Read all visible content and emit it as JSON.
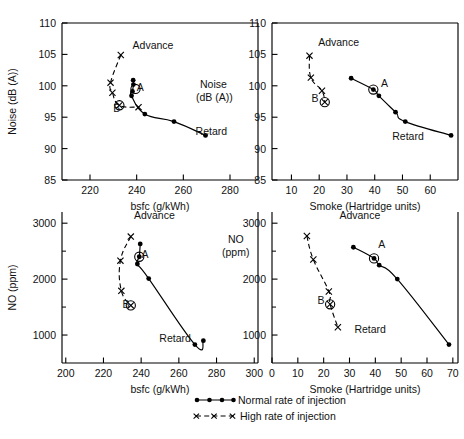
{
  "header": {
    "running_head": ""
  },
  "figure": {
    "legend": {
      "normal": {
        "label": "Normal rate of injection",
        "marker": "filled-circle",
        "line": "solid"
      },
      "high": {
        "label": "High rate of injection",
        "marker": "x-cross",
        "line": "dashed"
      }
    },
    "annotations": {
      "advance": "Advance",
      "retard": "Retard",
      "point_a": "A",
      "point_b": "B"
    }
  },
  "chart_data": [
    {
      "id": "noise-vs-bsfc",
      "panel": "top-left",
      "type": "scatter",
      "title": "",
      "xlabel": "bsfc (g/kWh)",
      "ylabel": "Noise (dB (A))",
      "inner_label": "Noise\n(dB (A))",
      "xlim": [
        208,
        292
      ],
      "ylim": [
        85,
        110
      ],
      "xticks": [
        220,
        240,
        260,
        280
      ],
      "yticks": [
        85,
        90,
        95,
        100,
        105,
        110
      ],
      "grid": false,
      "legend_position": "figure-bottom-right",
      "annotations": [
        {
          "text": "Advance",
          "x": 247,
          "y": 105.8
        },
        {
          "text": "Retard",
          "x": 272,
          "y": 92.2
        },
        {
          "text": "A",
          "x": 241.5,
          "y": 99.2
        },
        {
          "text": "B",
          "x": 231.5,
          "y": 95.9
        }
      ],
      "series": [
        {
          "name": "Normal rate of injection",
          "marker": "filled-circle",
          "line": "solid",
          "points": [
            {
              "x": 238.5,
              "y": 100.9
            },
            {
              "x": 238.6,
              "y": 100.2
            },
            {
              "x": 238.2,
              "y": 99.1
            },
            {
              "x": 237.8,
              "y": 98.4
            },
            {
              "x": 243.5,
              "y": 95.5
            },
            {
              "x": 256.0,
              "y": 94.3
            },
            {
              "x": 269.5,
              "y": 92.1
            }
          ],
          "marked_points": [
            {
              "label": "A",
              "x": 239.5,
              "y": 99.5
            }
          ]
        },
        {
          "name": "High rate of injection",
          "marker": "x-cross",
          "line": "dashed",
          "points": [
            {
              "x": 233.2,
              "y": 104.9
            },
            {
              "x": 228.8,
              "y": 100.5
            },
            {
              "x": 229.6,
              "y": 98.9
            },
            {
              "x": 232.6,
              "y": 96.9
            },
            {
              "x": 240.8,
              "y": 96.6
            }
          ],
          "marked_points": [
            {
              "label": "B",
              "x": 232.6,
              "y": 96.9
            }
          ]
        }
      ]
    },
    {
      "id": "noise-vs-smoke",
      "panel": "top-right",
      "type": "scatter",
      "title": "",
      "xlabel": "Smoke (Hartridge units)",
      "ylabel": "Noise (dB (A))",
      "xlim": [
        3,
        70
      ],
      "ylim": [
        85,
        110
      ],
      "xticks": [
        10,
        20,
        30,
        40,
        50,
        60
      ],
      "yticks": [
        85,
        90,
        95,
        100,
        105,
        110
      ],
      "grid": false,
      "annotations": [
        {
          "text": "Advance",
          "x": 27,
          "y": 106.4
        },
        {
          "text": "Retard",
          "x": 52,
          "y": 91.4
        },
        {
          "text": "A",
          "x": 43.5,
          "y": 99.8
        },
        {
          "text": "B",
          "x": 18.5,
          "y": 97.4
        }
      ],
      "series": [
        {
          "name": "Normal rate of injection",
          "marker": "filled-circle",
          "line": "solid",
          "points": [
            {
              "x": 31.5,
              "y": 101.2
            },
            {
              "x": 39.5,
              "y": 99.4
            },
            {
              "x": 41.5,
              "y": 98.4
            },
            {
              "x": 47.5,
              "y": 95.8
            },
            {
              "x": 51.0,
              "y": 94.3
            },
            {
              "x": 67.5,
              "y": 92.1
            }
          ],
          "marked_points": [
            {
              "label": "A",
              "x": 39.5,
              "y": 99.4
            }
          ]
        },
        {
          "name": "High rate of injection",
          "marker": "x-cross",
          "line": "dashed",
          "points": [
            {
              "x": 16.5,
              "y": 104.8
            },
            {
              "x": 17.0,
              "y": 101.3
            },
            {
              "x": 21.0,
              "y": 99.2
            },
            {
              "x": 22.0,
              "y": 97.4
            }
          ],
          "marked_points": [
            {
              "label": "B",
              "x": 22.0,
              "y": 97.4
            }
          ]
        }
      ]
    },
    {
      "id": "no-vs-bsfc",
      "panel": "bottom-left",
      "type": "scatter",
      "title": "",
      "xlabel": "bsfc (g/kWh)",
      "ylabel": "NO (ppm)",
      "xlim": [
        198,
        302
      ],
      "ylim": [
        500,
        3200
      ],
      "xticks": [
        200,
        220,
        240,
        260,
        280,
        300
      ],
      "yticks": [
        1000,
        2000,
        3000
      ],
      "yticks_minor": [
        1500,
        2500
      ],
      "grid": false,
      "annotations": [
        {
          "text": "Advance",
          "x": 247,
          "y": 3080
        },
        {
          "text": "Retard",
          "x": 258,
          "y": 880
        },
        {
          "text": "A",
          "x": 242,
          "y": 2370
        },
        {
          "text": "B",
          "x": 232,
          "y": 1480
        }
      ],
      "series": [
        {
          "name": "Normal rate of injection",
          "marker": "filled-circle",
          "line": "solid",
          "points": [
            {
              "x": 239.5,
              "y": 2630
            },
            {
              "x": 239.0,
              "y": 2400
            },
            {
              "x": 238.0,
              "y": 2270
            },
            {
              "x": 244.0,
              "y": 2010
            },
            {
              "x": 268.5,
              "y": 830
            },
            {
              "x": 273.0,
              "y": 900
            }
          ],
          "marked_points": [
            {
              "label": "A",
              "x": 239.0,
              "y": 2400
            }
          ]
        },
        {
          "name": "High rate of injection",
          "marker": "x-cross",
          "line": "dashed",
          "points": [
            {
              "x": 234.5,
              "y": 2760
            },
            {
              "x": 229.0,
              "y": 2330
            },
            {
              "x": 229.5,
              "y": 1790
            },
            {
              "x": 234.5,
              "y": 1530
            }
          ],
          "marked_points": [
            {
              "label": "B",
              "x": 234.5,
              "y": 1530
            }
          ]
        }
      ]
    },
    {
      "id": "no-vs-smoke",
      "panel": "bottom-right",
      "type": "scatter",
      "title": "",
      "xlabel": "Smoke (Hartridge units)",
      "ylabel": "NO (ppm)",
      "inner_label": "NO\n(ppm)",
      "xlim": [
        0,
        72
      ],
      "ylim": [
        500,
        3200
      ],
      "xticks": [
        0,
        10,
        20,
        30,
        40,
        50,
        60,
        70
      ],
      "yticks": [
        1000,
        2000,
        3000
      ],
      "yticks_minor": [
        1500,
        2500
      ],
      "grid": false,
      "annotations": [
        {
          "text": "Advance",
          "x": 34,
          "y": 3080
        },
        {
          "text": "Retard",
          "x": 38,
          "y": 1040
        },
        {
          "text": "A",
          "x": 42.5,
          "y": 2560
        },
        {
          "text": "B",
          "x": 19.0,
          "y": 1560
        }
      ],
      "series": [
        {
          "name": "Normal rate of injection",
          "marker": "filled-circle",
          "line": "solid",
          "points": [
            {
              "x": 31.5,
              "y": 2570
            },
            {
              "x": 39.5,
              "y": 2370
            },
            {
              "x": 41.5,
              "y": 2250
            },
            {
              "x": 48.5,
              "y": 2000
            },
            {
              "x": 68.5,
              "y": 830
            }
          ],
          "marked_points": [
            {
              "label": "A",
              "x": 39.5,
              "y": 2370
            }
          ]
        },
        {
          "name": "High rate of injection",
          "marker": "x-cross",
          "line": "dashed",
          "points": [
            {
              "x": 13.5,
              "y": 2770
            },
            {
              "x": 16.0,
              "y": 2350
            },
            {
              "x": 22.0,
              "y": 1780
            },
            {
              "x": 22.5,
              "y": 1550
            },
            {
              "x": 25.5,
              "y": 1140
            }
          ],
          "marked_points": [
            {
              "label": "B",
              "x": 22.5,
              "y": 1550
            }
          ]
        }
      ]
    }
  ]
}
